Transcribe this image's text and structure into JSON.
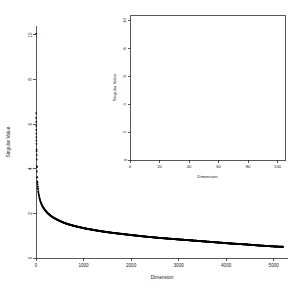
{
  "figure": {
    "background_color": "#ffffff",
    "point_color": "#000000",
    "axis_color": "#111111"
  },
  "chart_data": [
    {
      "id": "main",
      "type": "scatter",
      "title": "",
      "xlabel": "Dimension",
      "ylabel": "Singular Value",
      "xlim": [
        0,
        5300
      ],
      "ylim": [
        0,
        10.4
      ],
      "xticks": [
        0,
        1000,
        2000,
        3000,
        4000,
        5000
      ],
      "xtick_labels": [
        "0",
        "1000",
        "2000",
        "3000",
        "4000",
        "5000"
      ],
      "yticks": [
        0,
        2,
        4,
        6,
        8,
        10
      ],
      "ytick_labels": [
        "0",
        "2",
        "4",
        "6",
        "8",
        "10"
      ],
      "grid": false,
      "legend": false,
      "axis_style": "L-shaped",
      "description": "Singular value spectrum showing sharp power-law decay; a single leading outlier near 10, discrete resolvable points for the first few dozen dimensions, then a dense continuous decaying curve.",
      "x": [
        1,
        2,
        3,
        4,
        5,
        6,
        7,
        8,
        9,
        10,
        12,
        14,
        16,
        18,
        20,
        24,
        28,
        32,
        36,
        40,
        50,
        60,
        70,
        80,
        90,
        100,
        125,
        150,
        175,
        200,
        250,
        300,
        350,
        400,
        500,
        600,
        700,
        800,
        900,
        1000,
        1200,
        1400,
        1600,
        1800,
        2000,
        2300,
        2600,
        2900,
        3200,
        3500,
        3800,
        4100,
        4400,
        4700,
        5000,
        5200
      ],
      "y": [
        10.05,
        6.5,
        6.28,
        6.1,
        5.92,
        5.74,
        5.58,
        5.42,
        5.27,
        5.12,
        4.86,
        4.62,
        4.42,
        4.12,
        3.88,
        3.62,
        3.44,
        3.3,
        3.2,
        3.12,
        2.95,
        2.82,
        2.72,
        2.64,
        2.56,
        2.5,
        2.37,
        2.27,
        2.19,
        2.12,
        2.0,
        1.91,
        1.83,
        1.77,
        1.66,
        1.57,
        1.5,
        1.44,
        1.39,
        1.34,
        1.26,
        1.19,
        1.13,
        1.08,
        1.03,
        0.96,
        0.9,
        0.85,
        0.8,
        0.75,
        0.7,
        0.65,
        0.61,
        0.56,
        0.52,
        0.5
      ]
    },
    {
      "id": "inset",
      "type": "scatter",
      "title": "",
      "xlabel": "Dimension",
      "ylabel": "Singular Value",
      "xlim": [
        0,
        105
      ],
      "ylim": [
        0,
        10.4
      ],
      "xticks": [
        0,
        20,
        40,
        60,
        80,
        100
      ],
      "xtick_labels": [
        "0",
        "20",
        "40",
        "60",
        "80",
        "100"
      ],
      "yticks": [
        0,
        2,
        4,
        6,
        8,
        10
      ],
      "ytick_labels": [
        "0",
        "2",
        "4",
        "6",
        "8",
        "10"
      ],
      "grid": false,
      "legend": false,
      "axis_style": "box",
      "description": "Zoomed view of the first 100 dimensions of the singular value spectrum; leading outlier near 10, then a decay from about 6.5 down to about 2.1.",
      "x": [
        1,
        2,
        3,
        4,
        5,
        6,
        7,
        8,
        9,
        10,
        11,
        12,
        13,
        14,
        15,
        16,
        17,
        18,
        19,
        20,
        21,
        22,
        23,
        24,
        25,
        26,
        27,
        28,
        29,
        30,
        32,
        34,
        36,
        38,
        40,
        42,
        44,
        46,
        48,
        50,
        53,
        56,
        59,
        62,
        65,
        68,
        71,
        74,
        77,
        80,
        84,
        88,
        92,
        96,
        100
      ],
      "y": [
        10.05,
        6.5,
        6.28,
        6.1,
        5.92,
        5.74,
        5.58,
        5.42,
        5.27,
        5.12,
        4.99,
        4.86,
        4.73,
        4.62,
        4.5,
        4.42,
        4.3,
        4.12,
        3.99,
        3.88,
        3.79,
        3.72,
        3.66,
        3.62,
        3.55,
        3.5,
        3.47,
        3.44,
        3.39,
        3.35,
        3.3,
        3.25,
        3.2,
        3.16,
        3.12,
        3.07,
        3.03,
        3.0,
        2.98,
        2.95,
        2.9,
        2.86,
        2.83,
        2.81,
        2.78,
        2.74,
        2.7,
        2.67,
        2.65,
        2.64,
        2.58,
        2.54,
        2.48,
        2.44,
        2.38
      ]
    }
  ]
}
